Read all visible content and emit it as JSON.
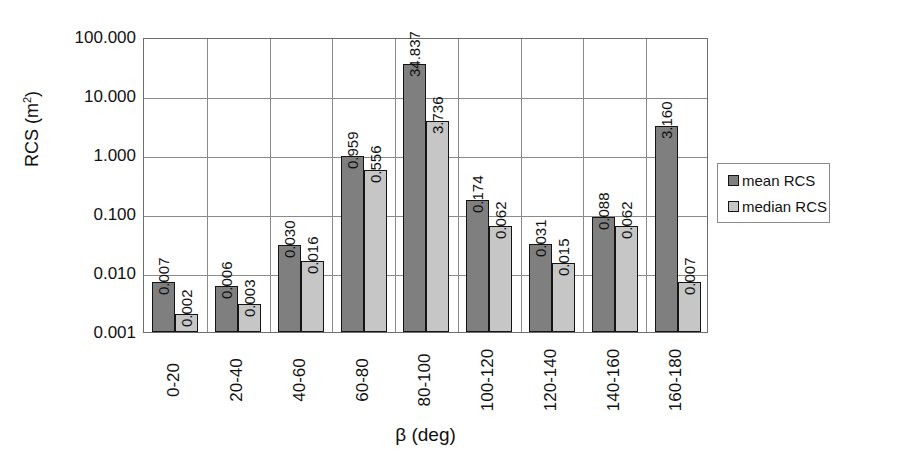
{
  "chart_data": {
    "type": "bar",
    "title": "",
    "xlabel": "β (deg)",
    "ylabel": "RCS (m",
    "ylabel_sup": "2",
    "ylabel_suffix": ")",
    "yscale": "log",
    "ylim": [
      0.001,
      100.0
    ],
    "ytick_labels": [
      "100.000",
      "10.000",
      "1.000",
      "0.100",
      "0.010",
      "0.001"
    ],
    "ytick_values": [
      100.0,
      10.0,
      1.0,
      0.1,
      0.01,
      0.001
    ],
    "grid": true,
    "legend_position": "right",
    "categories": [
      "0-20",
      "20-40",
      "40-60",
      "60-80",
      "80-100",
      "100-120",
      "120-140",
      "140-160",
      "160-180"
    ],
    "series": [
      {
        "name": "mean RCS",
        "color": "#7f7f7f",
        "values": [
          0.007,
          0.006,
          0.03,
          0.959,
          34.837,
          0.174,
          0.031,
          0.088,
          3.16
        ],
        "labels": [
          "0.007",
          "0.006",
          "0.030",
          "0.959",
          "34.837",
          "0.174",
          "0.031",
          "0.088",
          "3.160"
        ]
      },
      {
        "name": "median RCS",
        "color": "#c6c6c6",
        "values": [
          0.002,
          0.003,
          0.016,
          0.556,
          3.736,
          0.062,
          0.015,
          0.062,
          0.007
        ],
        "labels": [
          "0.002",
          "0.003",
          "0.016",
          "0.556",
          "3.736",
          "0.062",
          "0.015",
          "0.062",
          "0.007"
        ]
      }
    ]
  },
  "legend": {
    "items": [
      {
        "label": "mean RCS",
        "color": "#7f7f7f"
      },
      {
        "label": "median RCS",
        "color": "#c6c6c6"
      }
    ]
  }
}
